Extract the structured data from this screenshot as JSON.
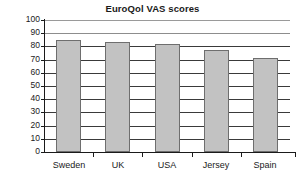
{
  "chart_data": {
    "type": "bar",
    "title": "EuroQol VAS scores",
    "xlabel": "",
    "ylabel": "",
    "categories": [
      "Sweden",
      "UK",
      "USA",
      "Jersey",
      "Spain"
    ],
    "values": [
      85,
      83,
      82,
      77,
      71.5
    ],
    "ylim": [
      0,
      100
    ],
    "ytick_labels": [
      "100",
      "90",
      "80",
      "70",
      "60",
      "50",
      "40",
      "30",
      "20",
      "10",
      "0"
    ],
    "ytick_values": [
      100,
      90,
      80,
      70,
      60,
      50,
      40,
      30,
      20,
      10,
      0
    ],
    "grid": true,
    "legend": false,
    "legend_position": "none",
    "series": [
      {
        "name": "EuroQol VAS score",
        "values": [
          85,
          83,
          82,
          77,
          71.5
        ]
      }
    ],
    "colors": {
      "bar_fill": "#c2c2c2",
      "bar_border": "#6e6e6e",
      "gridline": "#3a3a3a",
      "axis": "#1a1a1a",
      "background": "#ffffff",
      "text": "#1a1a1a"
    }
  }
}
